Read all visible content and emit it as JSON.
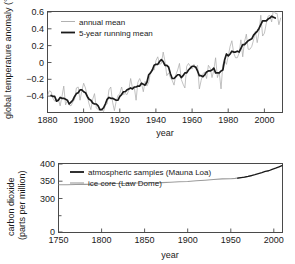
{
  "figure": {
    "background": "#ffffff",
    "axis_color": "#4a4a4a",
    "text_color": "#1a1a1a"
  },
  "chart_data": [
    {
      "id": "global-temperature-anomaly",
      "type": "line",
      "title": "",
      "xlabel": "year",
      "ylabel": "global temperature anomaly (°C)",
      "xlim": [
        1880,
        2010
      ],
      "ylim": [
        -0.45,
        0.62
      ],
      "xticks": [
        1880,
        1900,
        1920,
        1940,
        1960,
        1980,
        2000
      ],
      "xticklabels": [
        "1880",
        "1900",
        "1920",
        "1940",
        "1960",
        "1980",
        "2000"
      ],
      "yticks": [
        -0.4,
        -0.2,
        0,
        0.2,
        0.4,
        0.6
      ],
      "yticklabels": [
        "−0.4",
        "−0.2",
        "0",
        "0.2",
        "0.4",
        "0.6"
      ],
      "grid": false,
      "legend_position": "top-left",
      "series": [
        {
          "name": "annual mean",
          "color": "#a8a8a8",
          "width": 0.7,
          "x": [
            1880,
            1881,
            1882,
            1883,
            1884,
            1885,
            1886,
            1887,
            1888,
            1889,
            1890,
            1891,
            1892,
            1893,
            1894,
            1895,
            1896,
            1897,
            1898,
            1899,
            1900,
            1901,
            1902,
            1903,
            1904,
            1905,
            1906,
            1907,
            1908,
            1909,
            1910,
            1911,
            1912,
            1913,
            1914,
            1915,
            1916,
            1917,
            1918,
            1919,
            1920,
            1921,
            1922,
            1923,
            1924,
            1925,
            1926,
            1927,
            1928,
            1929,
            1930,
            1931,
            1932,
            1933,
            1934,
            1935,
            1936,
            1937,
            1938,
            1939,
            1940,
            1941,
            1942,
            1943,
            1944,
            1945,
            1946,
            1947,
            1948,
            1949,
            1950,
            1951,
            1952,
            1953,
            1954,
            1955,
            1956,
            1957,
            1958,
            1959,
            1960,
            1961,
            1962,
            1963,
            1964,
            1965,
            1966,
            1967,
            1968,
            1969,
            1970,
            1971,
            1972,
            1973,
            1974,
            1975,
            1976,
            1977,
            1978,
            1979,
            1980,
            1981,
            1982,
            1983,
            1984,
            1985,
            1986,
            1987,
            1988,
            1989,
            1990,
            1991,
            1992,
            1993,
            1994,
            1995,
            1996,
            1997,
            1998,
            1999,
            2000,
            2001,
            2002,
            2003,
            2004,
            2005,
            2006,
            2007,
            2008,
            2009
          ],
          "values": [
            -0.27,
            -0.22,
            -0.23,
            -0.3,
            -0.33,
            -0.32,
            -0.31,
            -0.38,
            -0.28,
            -0.17,
            -0.37,
            -0.32,
            -0.37,
            -0.38,
            -0.34,
            -0.31,
            -0.19,
            -0.18,
            -0.32,
            -0.22,
            -0.14,
            -0.19,
            -0.28,
            -0.36,
            -0.42,
            -0.31,
            -0.25,
            -0.4,
            -0.42,
            -0.43,
            -0.42,
            -0.44,
            -0.37,
            -0.36,
            -0.21,
            -0.18,
            -0.34,
            -0.43,
            -0.33,
            -0.27,
            -0.25,
            -0.18,
            -0.26,
            -0.25,
            -0.26,
            -0.21,
            -0.09,
            -0.19,
            -0.18,
            -0.32,
            -0.13,
            -0.09,
            -0.14,
            -0.23,
            -0.12,
            -0.17,
            -0.13,
            -0.02,
            0.01,
            0.0,
            0.1,
            0.14,
            0.06,
            0.07,
            0.19,
            0.09,
            -0.06,
            -0.03,
            -0.08,
            -0.11,
            -0.16,
            -0.05,
            0.0,
            0.07,
            -0.1,
            -0.15,
            -0.19,
            0.04,
            0.07,
            0.04,
            0.01,
            0.06,
            0.02,
            0.05,
            -0.2,
            -0.11,
            -0.04,
            -0.02,
            -0.09,
            0.05,
            0.02,
            -0.08,
            0.0,
            0.13,
            -0.08,
            -0.02,
            -0.2,
            0.06,
            0.1,
            0.06,
            0.15,
            0.25,
            0.31,
            0.18,
            0.13,
            0.13,
            0.18,
            0.32,
            0.14,
            0.3,
            0.38,
            0.22,
            0.22,
            0.25,
            0.32,
            0.41,
            0.29,
            0.4,
            0.58,
            0.36,
            0.39,
            0.49,
            0.57,
            0.58,
            0.51,
            0.64,
            0.6,
            0.6,
            0.48,
            0.55
          ]
        },
        {
          "name": "5-year running mean",
          "color": "#1a1a1a",
          "width": 1.7,
          "x": [
            1882,
            1883,
            1884,
            1885,
            1886,
            1887,
            1888,
            1889,
            1890,
            1891,
            1892,
            1893,
            1894,
            1895,
            1896,
            1897,
            1898,
            1899,
            1900,
            1901,
            1902,
            1903,
            1904,
            1905,
            1906,
            1907,
            1908,
            1909,
            1910,
            1911,
            1912,
            1913,
            1914,
            1915,
            1916,
            1917,
            1918,
            1919,
            1920,
            1921,
            1922,
            1923,
            1924,
            1925,
            1926,
            1927,
            1928,
            1929,
            1930,
            1931,
            1932,
            1933,
            1934,
            1935,
            1936,
            1937,
            1938,
            1939,
            1940,
            1941,
            1942,
            1943,
            1944,
            1945,
            1946,
            1947,
            1948,
            1949,
            1950,
            1951,
            1952,
            1953,
            1954,
            1955,
            1956,
            1957,
            1958,
            1959,
            1960,
            1961,
            1962,
            1963,
            1964,
            1965,
            1966,
            1967,
            1968,
            1969,
            1970,
            1971,
            1972,
            1973,
            1974,
            1975,
            1976,
            1977,
            1978,
            1979,
            1980,
            1981,
            1982,
            1983,
            1984,
            1985,
            1986,
            1987,
            1988,
            1989,
            1990,
            1991,
            1992,
            1993,
            1994,
            1995,
            1996,
            1997,
            1998,
            1999,
            2000,
            2001,
            2002,
            2003,
            2004,
            2005,
            2006,
            2007
          ],
          "values": [
            -0.27,
            -0.28,
            -0.28,
            -0.33,
            -0.32,
            -0.29,
            -0.3,
            -0.3,
            -0.31,
            -0.32,
            -0.36,
            -0.34,
            -0.32,
            -0.28,
            -0.25,
            -0.24,
            -0.21,
            -0.21,
            -0.23,
            -0.24,
            -0.28,
            -0.31,
            -0.32,
            -0.35,
            -0.36,
            -0.36,
            -0.38,
            -0.42,
            -0.42,
            -0.4,
            -0.36,
            -0.31,
            -0.29,
            -0.3,
            -0.3,
            -0.31,
            -0.32,
            -0.32,
            -0.28,
            -0.26,
            -0.23,
            -0.23,
            -0.21,
            -0.2,
            -0.19,
            -0.2,
            -0.18,
            -0.18,
            -0.17,
            -0.17,
            -0.14,
            -0.15,
            -0.16,
            -0.13,
            -0.05,
            -0.03,
            -0.0,
            0.05,
            0.06,
            0.06,
            0.09,
            0.11,
            0.09,
            0.05,
            0.05,
            0.03,
            -0.04,
            -0.09,
            -0.09,
            -0.07,
            -0.05,
            -0.05,
            -0.08,
            -0.06,
            -0.03,
            -0.03,
            0.0,
            0.02,
            0.04,
            0.04,
            0.03,
            -0.01,
            -0.06,
            -0.06,
            -0.07,
            -0.05,
            -0.02,
            -0.01,
            -0.01,
            0.0,
            0.02,
            -0.03,
            -0.03,
            -0.03,
            -0.01,
            0.0,
            0.11,
            0.17,
            0.15,
            0.17,
            0.2,
            0.19,
            0.19,
            0.2,
            0.19,
            0.23,
            0.27,
            0.27,
            0.29,
            0.31,
            0.32,
            0.33,
            0.37,
            0.39,
            0.41,
            0.44,
            0.48,
            0.52,
            0.52,
            0.52,
            0.54,
            0.55,
            0.57,
            0.56,
            0.55
          ]
        }
      ],
      "legend": [
        {
          "label": "annual mean",
          "color": "#a8a8a8"
        },
        {
          "label": "5-year running mean",
          "color": "#1a1a1a"
        }
      ]
    },
    {
      "id": "carbon-dioxide-concentration",
      "type": "line",
      "title": "",
      "xlabel": "year",
      "ylabel": "carbon dioxide (parts per million)",
      "ylabel_line1": "carbon dioxide",
      "ylabel_line2": "(parts per million)",
      "xlim": [
        1750,
        2010
      ],
      "ylim": [
        0,
        400
      ],
      "xticks": [
        1750,
        1800,
        1850,
        1900,
        1950,
        2000
      ],
      "xticklabels": [
        "1750",
        "1800",
        "1850",
        "1900",
        "1950",
        "2000"
      ],
      "yticks": [
        0,
        300,
        350,
        400
      ],
      "yticklabels": [
        "0",
        "300",
        "350",
        "400"
      ],
      "yminorticks": [
        50,
        100,
        150,
        200,
        250
      ],
      "grid": false,
      "legend_position": "top-left",
      "series": [
        {
          "name": "ice core (Law Dome)",
          "color": "#9b9b9b",
          "width": 1.1,
          "x": [
            1750,
            1760,
            1770,
            1780,
            1790,
            1800,
            1810,
            1820,
            1830,
            1840,
            1850,
            1860,
            1870,
            1880,
            1890,
            1900,
            1910,
            1920,
            1930,
            1940,
            1950,
            1955,
            1960,
            1965,
            1970,
            1975
          ],
          "values": [
            277,
            277,
            278,
            279,
            280,
            282,
            284,
            284,
            284,
            287,
            287,
            288,
            289,
            291,
            294,
            296,
            300,
            303,
            307,
            311,
            312,
            314,
            317,
            320,
            325,
            331
          ]
        },
        {
          "name": "atmospheric samples (Mauna Loa)",
          "color": "#1a1a1a",
          "width": 1.3,
          "x": [
            1958,
            1962,
            1966,
            1970,
            1974,
            1978,
            1982,
            1986,
            1990,
            1994,
            1998,
            2002,
            2006,
            2010
          ],
          "values": [
            315,
            318,
            321,
            325,
            330,
            335,
            341,
            347,
            354,
            358,
            366,
            373,
            381,
            389
          ]
        }
      ],
      "legend": [
        {
          "label": "atmospheric samples (Mauna Loa)",
          "color": "#1a1a1a"
        },
        {
          "label": "ice core (Law Dome)",
          "color": "#9b9b9b"
        }
      ]
    }
  ]
}
